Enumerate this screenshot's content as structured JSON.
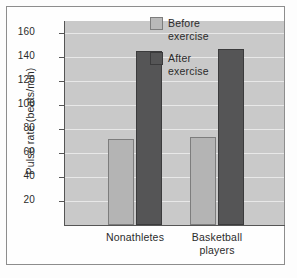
{
  "chart_data": {
    "type": "bar",
    "title": "",
    "xlabel": "",
    "ylabel": "Pulse rate (beats/min)",
    "categories": [
      "Nonathletes",
      "Basketball players"
    ],
    "category_lines": [
      [
        "Nonathletes"
      ],
      [
        "Basketball",
        "players"
      ]
    ],
    "series": [
      {
        "name": "Before exercise",
        "values": [
          72,
          73
        ],
        "color": "#b4b4b4"
      },
      {
        "name": "After exercise",
        "values": [
          145,
          147
        ],
        "color": "#555556"
      }
    ],
    "ylim": [
      0,
      170
    ],
    "yticks": [
      20,
      40,
      60,
      80,
      100,
      120,
      140,
      160
    ],
    "ytick_labels": [
      "20",
      "40",
      "60",
      "80",
      "100",
      "120",
      "140",
      "160"
    ],
    "grid": "horizontal",
    "legend_position": "top-right",
    "legend": [
      {
        "label_lines": [
          "Before",
          "exercise"
        ],
        "swatch": "before"
      },
      {
        "label_lines": [
          "After",
          "exercise"
        ],
        "swatch": "after"
      }
    ],
    "plot_background": "#c9c9c9",
    "gridline_color": "#e8e8e8"
  }
}
